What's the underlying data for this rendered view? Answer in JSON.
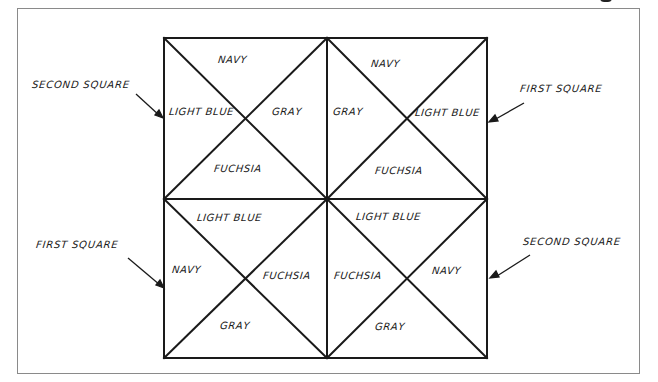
{
  "diagram": {
    "type": "quilt-block-color-layout",
    "colors": {
      "line": "#1a1a1a",
      "frame": "#8a8a8a",
      "background": "#ffffff"
    },
    "blocks": [
      {
        "position": "top-left",
        "top": "NAVY",
        "left": "LIGHT BLUE",
        "right": "GRAY",
        "bottom": "FUCHSIA"
      },
      {
        "position": "top-right",
        "top": "NAVY",
        "left": "GRAY",
        "right": "LIGHT BLUE",
        "bottom": "FUCHSIA"
      },
      {
        "position": "bottom-left",
        "top": "LIGHT BLUE",
        "left": "NAVY",
        "right": "FUCHSIA",
        "bottom": "GRAY"
      },
      {
        "position": "bottom-right",
        "top": "LIGHT BLUE",
        "left": "FUCHSIA",
        "right": "NAVY",
        "bottom": "GRAY"
      }
    ],
    "callouts": [
      {
        "text": "SECOND SQUARE",
        "points_to": "top-left"
      },
      {
        "text": "FIRST SQUARE",
        "points_to": "top-right"
      },
      {
        "text": "FIRST SQUARE",
        "points_to": "bottom-left"
      },
      {
        "text": "SECOND SQUARE",
        "points_to": "bottom-right"
      }
    ]
  }
}
